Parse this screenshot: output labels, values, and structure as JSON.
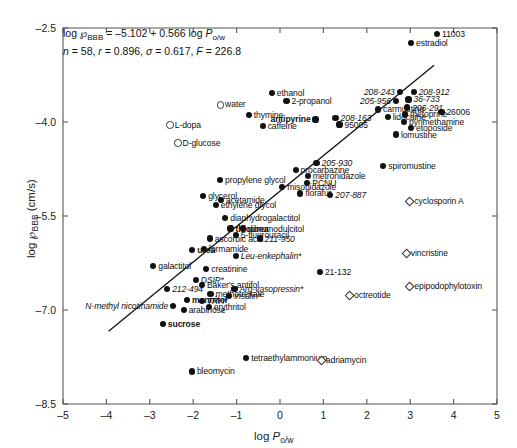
{
  "chart_data": {
    "type": "scatter",
    "title": "",
    "xlabel": "log P o/w",
    "ylabel": "log P BBB (cm/s)",
    "xlim": [
      -5,
      5
    ],
    "ylim": [
      -8.5,
      -2.5
    ],
    "xticks": [
      "-5",
      "-4",
      "-3",
      "-2",
      "-1",
      "0",
      "1",
      "2",
      "3",
      "4",
      "5"
    ],
    "yticks": [
      "-2.5",
      "-4.0",
      "-5.5",
      "-7.0",
      "-8.5"
    ],
    "grid": false,
    "legend": "none",
    "annotation_line1": "log ℘BBB = –5.102 + 0.566 log Po/w",
    "annotation_line2": "n = 58, r = 0.896, σ = 0.617, F = 226.8",
    "regression": {
      "intercept": -5.102,
      "slope": 0.566,
      "x_start": -3.95,
      "x_end": 3.55
    },
    "series": [
      {
        "name": "correlated compounds",
        "marker": "filled-circle",
        "points": [
          {
            "label": "11003",
            "x": 3.62,
            "y": -2.6,
            "anchor": "l",
            "style": "plain"
          },
          {
            "label": "estradiol",
            "x": 3.02,
            "y": -2.74,
            "anchor": "l",
            "style": "plain"
          },
          {
            "label": "208-243",
            "x": 2.76,
            "y": -3.52,
            "anchor": "r",
            "style": "italic"
          },
          {
            "label": "208-912",
            "x": 3.08,
            "y": -3.52,
            "anchor": "l",
            "style": "italic"
          },
          {
            "label": "36-733",
            "x": 2.96,
            "y": -3.64,
            "anchor": "l",
            "style": "italic"
          },
          {
            "label": "205-956",
            "x": 2.67,
            "y": -3.66,
            "anchor": "r",
            "style": "italic"
          },
          {
            "label": "206-291",
            "x": 2.93,
            "y": -3.77,
            "anchor": "l",
            "style": "italic"
          },
          {
            "label": "26006",
            "x": 3.72,
            "y": -3.84,
            "anchor": "l",
            "style": "plain"
          },
          {
            "label": "metoprine",
            "x": 2.88,
            "y": -3.88,
            "anchor": "l",
            "style": "plain"
          },
          {
            "label": "carmustine",
            "x": 2.26,
            "y": -3.8,
            "anchor": "l",
            "style": "plain"
          },
          {
            "label": "lidocaine",
            "x": 2.48,
            "y": -3.92,
            "anchor": "l",
            "style": "plain"
          },
          {
            "label": "pyrimethamine",
            "x": 2.86,
            "y": -4.0,
            "anchor": "l",
            "style": "plain"
          },
          {
            "label": "etoposide",
            "x": 3.02,
            "y": -4.1,
            "anchor": "l",
            "style": "plain"
          },
          {
            "label": "lomustine",
            "x": 2.67,
            "y": -4.2,
            "anchor": "l",
            "style": "plain"
          },
          {
            "label": "208-163",
            "x": 1.28,
            "y": -3.93,
            "anchor": "l",
            "style": "italic"
          },
          {
            "label": "95005",
            "x": 1.37,
            "y": -4.04,
            "anchor": "l",
            "style": "plain"
          },
          {
            "label": "antipyrine",
            "x": 0.82,
            "y": -3.96,
            "anchor": "r",
            "style": "bold"
          },
          {
            "label": "ethanol",
            "x": -0.19,
            "y": -3.54,
            "anchor": "l",
            "style": "plain"
          },
          {
            "label": "2-propanol",
            "x": 0.15,
            "y": -3.66,
            "anchor": "l",
            "style": "plain"
          },
          {
            "label": "thymine",
            "x": -0.72,
            "y": -3.89,
            "anchor": "l",
            "style": "plain"
          },
          {
            "label": "caffeine",
            "x": -0.4,
            "y": -4.06,
            "anchor": "l",
            "style": "plain"
          },
          {
            "label": "spiromustine",
            "x": 2.38,
            "y": -4.7,
            "anchor": "l",
            "style": "plain"
          },
          {
            "label": "205-930",
            "x": 0.84,
            "y": -4.66,
            "anchor": "l",
            "style": "italic"
          },
          {
            "label": "procarbazine",
            "x": 0.36,
            "y": -4.77,
            "anchor": "l",
            "style": "plain"
          },
          {
            "label": "metronidazole",
            "x": 0.64,
            "y": -4.86,
            "anchor": "l",
            "style": "plain"
          },
          {
            "label": "PCNU",
            "x": 0.63,
            "y": -4.97,
            "anchor": "l",
            "style": "plain"
          },
          {
            "label": "propylene glycol",
            "x": -1.38,
            "y": -4.92,
            "anchor": "l",
            "style": "plain"
          },
          {
            "label": "misonidazole",
            "x": 0.05,
            "y": -5.04,
            "anchor": "l",
            "style": "plain"
          },
          {
            "label": "florafur",
            "x": 0.47,
            "y": -5.14,
            "anchor": "l",
            "style": "plain"
          },
          {
            "label": "207-887",
            "x": 1.16,
            "y": -5.17,
            "anchor": "l",
            "style": "italic"
          },
          {
            "label": "glycerol",
            "x": -1.77,
            "y": -5.18,
            "anchor": "l",
            "style": "plain"
          },
          {
            "label": "acetamide",
            "x": -1.36,
            "y": -5.24,
            "anchor": "l",
            "style": "plain"
          },
          {
            "label": "ethylene glycol",
            "x": -1.48,
            "y": -5.32,
            "anchor": "l",
            "style": "plain"
          },
          {
            "label": "dianhydrogalactitol",
            "x": -1.26,
            "y": -5.53,
            "anchor": "l",
            "style": "plain"
          },
          {
            "label": "thiourea",
            "x": -1.14,
            "y": -5.7,
            "anchor": "l",
            "style": "bold"
          },
          {
            "label": "dibromodulcitol",
            "x": -0.86,
            "y": -5.7,
            "anchor": "l",
            "style": "plain"
          },
          {
            "label": "5-fluorouracil",
            "x": -1.02,
            "y": -5.8,
            "anchor": "l",
            "style": "plain"
          },
          {
            "label": "ascorbic acid",
            "x": -1.62,
            "y": -5.86,
            "anchor": "l",
            "style": "plain"
          },
          {
            "label": "211-950",
            "x": -0.47,
            "y": -5.86,
            "anchor": "l",
            "style": "italic"
          },
          {
            "label": "urea",
            "x": -2.02,
            "y": -6.04,
            "anchor": "l",
            "style": "bold"
          },
          {
            "label": "formamide",
            "x": -1.76,
            "y": -6.03,
            "anchor": "l",
            "style": "plain"
          },
          {
            "label": "Leu-enkephalin*",
            "x": -1.02,
            "y": -6.14,
            "anchor": "l",
            "style": "italic"
          },
          {
            "label": "galactitol",
            "x": -2.92,
            "y": -6.3,
            "anchor": "l",
            "style": "plain"
          },
          {
            "label": "creatinine",
            "x": -1.7,
            "y": -6.35,
            "anchor": "l",
            "style": "plain"
          },
          {
            "label": "21-132",
            "x": 0.92,
            "y": -6.39,
            "anchor": "l",
            "style": "plain"
          },
          {
            "label": "DSIP*",
            "x": -1.94,
            "y": -6.52,
            "anchor": "l",
            "style": "italic"
          },
          {
            "label": "212-494",
            "x": -2.6,
            "y": -6.66,
            "anchor": "l",
            "style": "italic"
          },
          {
            "label": "Baker's antifol",
            "x": -1.8,
            "y": -6.6,
            "anchor": "l",
            "style": "plain"
          },
          {
            "label": "Arg-vasopressin*",
            "x": -1.05,
            "y": -6.66,
            "anchor": "l",
            "style": "italic"
          },
          {
            "label": "methotrexate",
            "x": -1.6,
            "y": -6.74,
            "anchor": "l",
            "style": "plain"
          },
          {
            "label": "insulin*",
            "x": -1.17,
            "y": -6.78,
            "anchor": "l",
            "style": "italic"
          },
          {
            "label": "mannitol",
            "x": -2.14,
            "y": -6.84,
            "anchor": "l",
            "style": "bold"
          },
          {
            "label": "TRH*",
            "x": -1.8,
            "y": -6.86,
            "anchor": "l",
            "style": "italic"
          },
          {
            "label": "N-methyl nicotinamide",
            "x": -2.46,
            "y": -6.93,
            "anchor": "r",
            "style": "italic"
          },
          {
            "label": "erythritol",
            "x": -1.64,
            "y": -6.95,
            "anchor": "l",
            "style": "plain"
          },
          {
            "label": "arabinose",
            "x": -2.22,
            "y": -7.0,
            "anchor": "l",
            "style": "plain"
          },
          {
            "label": "sucrose",
            "x": -2.7,
            "y": -7.22,
            "anchor": "l",
            "style": "bold"
          },
          {
            "label": "tetraethylammonium",
            "x": -0.78,
            "y": -7.76,
            "anchor": "l",
            "style": "plain"
          },
          {
            "label": "bleomycin",
            "x": -2.03,
            "y": -7.98,
            "anchor": "l",
            "style": "plain"
          }
        ]
      },
      {
        "name": "small hydrophilic outliers",
        "marker": "open-circle",
        "points": [
          {
            "label": "water",
            "x": -1.38,
            "y": -3.72,
            "anchor": "l",
            "style": "plain"
          },
          {
            "label": "L-dopa",
            "x": -2.54,
            "y": -4.04,
            "anchor": "l",
            "style": "plain"
          },
          {
            "label": "D-glucose",
            "x": -2.36,
            "y": -4.33,
            "anchor": "l",
            "style": "plain"
          }
        ]
      },
      {
        "name": "efflux-transported outliers",
        "marker": "diamond",
        "points": [
          {
            "label": "cyclosporin A",
            "x": 2.98,
            "y": -5.26,
            "anchor": "l",
            "style": "plain"
          },
          {
            "label": "vincristine",
            "x": 2.9,
            "y": -6.09,
            "anchor": "l",
            "style": "plain"
          },
          {
            "label": "epipodophylotoxin",
            "x": 2.98,
            "y": -6.62,
            "anchor": "l",
            "style": "plain"
          },
          {
            "label": "octreotide",
            "x": 1.59,
            "y": -6.76,
            "anchor": "l",
            "style": "plain"
          },
          {
            "label": "adriamycin",
            "x": 0.94,
            "y": -7.8,
            "anchor": "l",
            "style": "plain"
          }
        ]
      }
    ]
  }
}
